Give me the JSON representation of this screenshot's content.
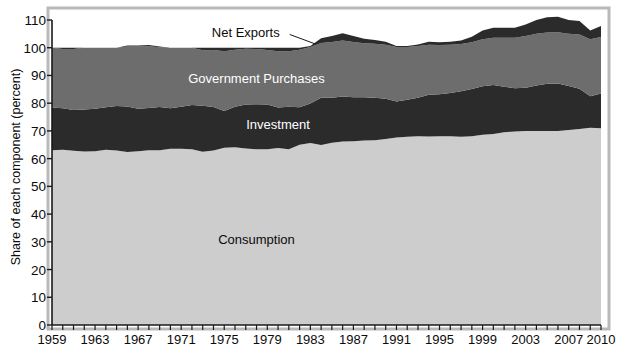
{
  "figure": {
    "ylabel": "Share of each component (percent)",
    "yticks": [
      0,
      10,
      20,
      30,
      40,
      50,
      60,
      70,
      80,
      90,
      100,
      110
    ],
    "xticks": [
      "1959",
      "1963",
      "1967",
      "1971",
      "1975",
      "1979",
      "1983",
      "1987",
      "1991",
      "1995",
      "1999",
      "2003",
      "2007",
      "2010"
    ],
    "colors": {
      "consumption": "#cdcdcd",
      "investment": "#2b2b2b",
      "government": "#6d6d6d",
      "net_exports": "#2b2b2b",
      "plot_background": "#ffffff",
      "axis": "#1a1a1a",
      "frame_shadow": "#b9b9b9"
    }
  },
  "chart_data": {
    "type": "area",
    "title": "",
    "subtitle": "",
    "xlabel": "",
    "ylabel": "Share of each component (percent)",
    "xlim": [
      1959,
      2010
    ],
    "ylim": [
      0,
      110
    ],
    "grid": false,
    "legend_position": "inline-annotations",
    "stacked": true,
    "annotations": [
      {
        "text": "Net Exports",
        "x": 1977.0,
        "y": 105.5,
        "color": "#0b0b0b",
        "leader_line_to": {
          "x": 1983.5,
          "y": 101.3
        }
      },
      {
        "text": "Government Purchases",
        "x": 1978.0,
        "y": 89.0,
        "color": "#ffffff"
      },
      {
        "text": "Investment",
        "x": 1980.0,
        "y": 72.5,
        "color": "#ffffff"
      },
      {
        "text": "Consumption",
        "x": 1978.0,
        "y": 31.0,
        "color": "#0b0b0b"
      }
    ],
    "x": [
      1959,
      1960,
      1961,
      1962,
      1963,
      1964,
      1965,
      1966,
      1967,
      1968,
      1969,
      1970,
      1971,
      1972,
      1973,
      1974,
      1975,
      1976,
      1977,
      1978,
      1979,
      1980,
      1981,
      1982,
      1983,
      1984,
      1985,
      1986,
      1987,
      1988,
      1989,
      1990,
      1991,
      1992,
      1993,
      1994,
      1995,
      1996,
      1997,
      1998,
      1999,
      2000,
      2001,
      2002,
      2003,
      2004,
      2005,
      2006,
      2007,
      2008,
      2009,
      2010
    ],
    "series": [
      {
        "name": "Consumption",
        "color": "#cdcdcd",
        "values": [
          63.0,
          63.2,
          62.8,
          62.6,
          62.7,
          63.2,
          62.9,
          62.4,
          62.7,
          63.0,
          63.0,
          63.6,
          63.6,
          63.4,
          62.5,
          62.9,
          63.9,
          64.1,
          63.7,
          63.4,
          63.4,
          63.8,
          63.4,
          65.0,
          65.6,
          64.9,
          65.7,
          66.2,
          66.3,
          66.5,
          66.6,
          67.1,
          67.6,
          67.9,
          68.1,
          68.0,
          68.1,
          68.1,
          67.9,
          68.1,
          68.6,
          68.9,
          69.5,
          69.8,
          70.0,
          70.0,
          70.0,
          70.0,
          70.3,
          70.7,
          71.1,
          71.0
        ]
      },
      {
        "name": "Investment",
        "color": "#2b2b2b",
        "values": [
          15.4,
          15.0,
          14.7,
          15.1,
          15.3,
          15.3,
          16.1,
          16.4,
          15.3,
          15.3,
          15.6,
          14.6,
          15.1,
          15.9,
          16.6,
          15.7,
          13.3,
          14.6,
          15.8,
          16.2,
          16.1,
          14.6,
          15.3,
          13.5,
          14.3,
          17.1,
          16.3,
          16.2,
          15.8,
          15.6,
          15.4,
          14.5,
          13.0,
          13.3,
          13.9,
          15.0,
          15.1,
          15.6,
          16.4,
          17.0,
          17.5,
          17.7,
          16.4,
          15.6,
          15.6,
          16.4,
          17.0,
          17.1,
          15.9,
          14.5,
          11.4,
          12.5
        ]
      },
      {
        "name": "Government Purchases",
        "color": "#6d6d6d",
        "values": [
          21.6,
          21.3,
          22.0,
          22.3,
          22.0,
          21.5,
          21.0,
          21.6,
          22.4,
          22.2,
          21.6,
          21.8,
          21.3,
          20.7,
          20.0,
          20.6,
          21.5,
          20.6,
          20.1,
          19.9,
          19.7,
          20.3,
          20.0,
          20.8,
          20.4,
          19.7,
          20.1,
          20.2,
          20.0,
          19.5,
          19.4,
          19.5,
          19.7,
          19.1,
          18.6,
          18.1,
          17.8,
          17.4,
          17.0,
          16.9,
          17.0,
          17.0,
          17.7,
          18.2,
          18.6,
          18.6,
          18.5,
          18.5,
          18.8,
          19.6,
          20.6,
          20.4
        ]
      },
      {
        "name": "Net Exports",
        "color": "#2b2b2b",
        "values": [
          0.0,
          0.5,
          0.5,
          0.0,
          0.0,
          0.0,
          0.0,
          -0.4,
          -0.4,
          -0.5,
          -0.2,
          0.0,
          0.0,
          0.0,
          0.9,
          0.8,
          1.3,
          0.7,
          0.4,
          0.5,
          0.8,
          1.3,
          1.3,
          0.7,
          -0.3,
          -1.7,
          -2.1,
          -2.6,
          -2.1,
          -1.6,
          -1.4,
          -1.1,
          -0.3,
          -0.3,
          -0.6,
          -1.1,
          -1.0,
          -1.1,
          -1.3,
          -2.0,
          -3.1,
          -3.6,
          -3.6,
          -3.6,
          -4.2,
          -5.0,
          -5.5,
          -5.6,
          -5.0,
          -4.8,
          -3.1,
          -3.9
        ]
      }
    ]
  }
}
